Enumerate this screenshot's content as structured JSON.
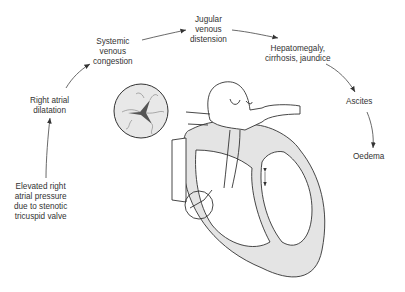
{
  "diagram": {
    "steps": [
      {
        "id": "elevated",
        "lines": [
          "Elevated right",
          "atrial pressure",
          "due to stenotic",
          "tricuspid valve"
        ]
      },
      {
        "id": "dilatation",
        "lines": [
          "Right atrial",
          "dilatation"
        ]
      },
      {
        "id": "congestion",
        "lines": [
          "Systemic",
          "venous",
          "congestion"
        ]
      },
      {
        "id": "jugular",
        "lines": [
          "Jugular",
          "venous",
          "distension"
        ]
      },
      {
        "id": "hepato",
        "lines": [
          "Hepatomegaly,",
          "cirrhosis, jaundice"
        ]
      },
      {
        "id": "ascites",
        "lines": [
          "Ascites"
        ]
      },
      {
        "id": "oedema",
        "lines": [
          "Oedema"
        ]
      }
    ],
    "colors": {
      "line": "#333333",
      "fill": "#e6e6e6",
      "text": "#333333"
    }
  }
}
